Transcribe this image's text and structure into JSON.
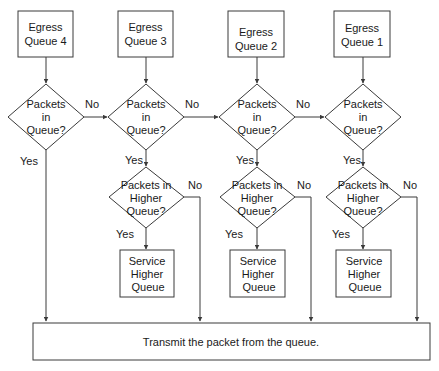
{
  "diagram": {
    "type": "flowchart",
    "colors": {
      "stroke": "#3a3a3a",
      "text": "#1a1a1a",
      "background": "#ffffff"
    },
    "queues": [
      {
        "id": "q4",
        "title_line1": "Egress",
        "title_line2": "Queue 4",
        "decision_line1": "Packets",
        "decision_line2": "in",
        "decision_line3": "Queue?",
        "yes_label": "Yes",
        "no_label": "No"
      },
      {
        "id": "q3",
        "title_line1": "Egress",
        "title_line2": "Queue 3",
        "decision_line1": "Packets",
        "decision_line2": "in",
        "decision_line3": "Queue?",
        "yes_label": "Yes",
        "no_label": "No",
        "higher_line1": "Packets in",
        "higher_line2": "Higher",
        "higher_line3": "Queue?",
        "higher_yes_label": "Yes",
        "higher_no_label": "No",
        "service_line1": "Service",
        "service_line2": "Higher",
        "service_line3": "Queue"
      },
      {
        "id": "q2",
        "title_line1": "Egress",
        "title_line2": "Queue 2",
        "decision_line1": "Packets",
        "decision_line2": "in",
        "decision_line3": "Queue?",
        "yes_label": "Yes",
        "no_label": "No",
        "higher_line1": "Packets in",
        "higher_line2": "Higher",
        "higher_line3": "Queue?",
        "higher_yes_label": "Yes",
        "higher_no_label": "No",
        "service_line1": "Service",
        "service_line2": "Higher",
        "service_line3": "Queue"
      },
      {
        "id": "q1",
        "title_line1": "Egress",
        "title_line2": "Queue 1",
        "decision_line1": "Packets",
        "decision_line2": "in",
        "decision_line3": "Queue?",
        "yes_label": "Yes",
        "higher_line1": "Packets in",
        "higher_line2": "Higher",
        "higher_line3": "Queue?",
        "higher_yes_label": "Yes",
        "higher_no_label": "No",
        "service_line1": "Service",
        "service_line2": "Higher",
        "service_line3": "Queue"
      }
    ],
    "transmit": {
      "label": "Transmit the packet from the queue."
    }
  }
}
